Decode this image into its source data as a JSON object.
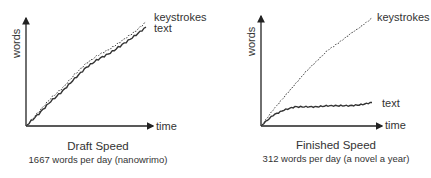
{
  "chart_data": [
    {
      "type": "line",
      "title": "Draft Speed",
      "subtitle": "1667 words per day (nanowrimo)",
      "xlabel": "time",
      "ylabel": "words",
      "grid": false,
      "legend": "inline labels at line ends",
      "axis_ticks": "none",
      "x": [
        0,
        0.1,
        0.2,
        0.3,
        0.4,
        0.5,
        0.6,
        0.7,
        0.8,
        0.9,
        1.0
      ],
      "series": [
        {
          "name": "keystrokes",
          "style": "dotted",
          "values": [
            0,
            0.13,
            0.26,
            0.36,
            0.49,
            0.6,
            0.68,
            0.74,
            0.82,
            0.9,
            1.0
          ]
        },
        {
          "name": "text",
          "style": "solid",
          "values": [
            0,
            0.11,
            0.23,
            0.33,
            0.45,
            0.56,
            0.64,
            0.7,
            0.78,
            0.86,
            0.95
          ]
        }
      ]
    },
    {
      "type": "line",
      "title": "Finished Speed",
      "subtitle": "312 words per day (a novel a year)",
      "xlabel": "time",
      "ylabel": "words",
      "grid": false,
      "legend": "inline labels at line ends",
      "axis_ticks": "none",
      "x": [
        0,
        0.1,
        0.2,
        0.3,
        0.4,
        0.5,
        0.6,
        0.7,
        0.8,
        0.9,
        1.0
      ],
      "series": [
        {
          "name": "keystrokes",
          "style": "dotted",
          "values": [
            0,
            0.14,
            0.26,
            0.38,
            0.5,
            0.6,
            0.7,
            0.77,
            0.85,
            0.92,
            1.0
          ]
        },
        {
          "name": "text",
          "style": "solid",
          "values": [
            0,
            0.09,
            0.14,
            0.17,
            0.17,
            0.17,
            0.18,
            0.18,
            0.18,
            0.19,
            0.21
          ]
        }
      ]
    }
  ],
  "left": {
    "ylabel": "words",
    "xlabel": "time",
    "series_labels": {
      "keystrokes": "keystrokes",
      "text": "text"
    },
    "title": "Draft Speed",
    "subtitle": "1667 words per day (nanowrimo)"
  },
  "right": {
    "ylabel": "words",
    "xlabel": "time",
    "series_labels": {
      "keystrokes": "keystrokes",
      "text": "text"
    },
    "title": "Finished Speed",
    "subtitle": "312 words per day (a novel a year)"
  },
  "colors": {
    "axis": "#222222",
    "line": "#333333",
    "text": "#333333"
  }
}
